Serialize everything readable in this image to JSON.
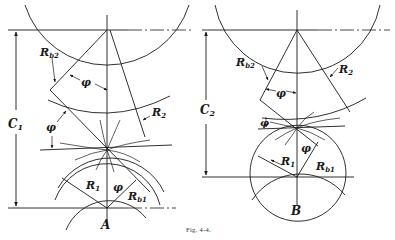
{
  "figure": {
    "caption": "Fig. 4-4.",
    "panels": [
      {
        "id": "A",
        "center_label": "A",
        "center_distance_label": "C",
        "center_distance_sub": "1",
        "labels": {
          "rb2": "R",
          "rb2_sub": "b2",
          "r2": "R",
          "r2_sub": "2",
          "r1": "R",
          "r1_sub": "1",
          "rb1": "R",
          "rb1_sub": "b1",
          "phi_upper": "φ",
          "phi_left": "φ",
          "phi_lower": "φ"
        }
      },
      {
        "id": "B",
        "center_label": "B",
        "center_distance_label": "C",
        "center_distance_sub": "2",
        "labels": {
          "rb2": "R",
          "rb2_sub": "b2",
          "r2": "R",
          "r2_sub": "2",
          "r1": "R",
          "r1_sub": "1",
          "rb1": "R",
          "rb1_sub": "b1",
          "phi_upper": "φ",
          "phi_left": "φ",
          "phi_lower": "φ"
        }
      }
    ]
  }
}
